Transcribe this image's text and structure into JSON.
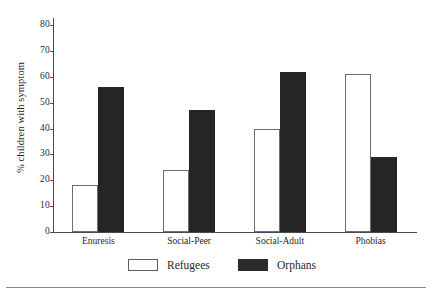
{
  "chart_data": {
    "type": "bar",
    "title": "",
    "xlabel": "",
    "ylabel": "% children with symptom",
    "ylim": [
      0,
      80
    ],
    "yticks": [
      0,
      10,
      20,
      30,
      40,
      50,
      60,
      70,
      80
    ],
    "ytick_labels": [
      "0",
      "10",
      "20",
      "30",
      "40",
      "50",
      "60",
      "70",
      "80"
    ],
    "grid": false,
    "legend_position": "bottom",
    "categories": [
      "Enuresis",
      "Social-Peer",
      "Social-Adult",
      "Phobias"
    ],
    "series": [
      {
        "name": "Refugees",
        "color": "#ffffff",
        "edge_color": "#6e6e6e",
        "values": [
          18,
          24,
          40,
          61
        ]
      },
      {
        "name": "Orphans",
        "color": "#252525",
        "edge_color": "#252525",
        "values": [
          56,
          47,
          62,
          29
        ]
      }
    ]
  },
  "legend": {
    "items": [
      {
        "label": "Refugees",
        "swatch": "open-square-swatch"
      },
      {
        "label": "Orphans",
        "swatch": "filled-square-swatch"
      }
    ]
  },
  "colors": {
    "axis": "#4a4a4a",
    "text": "#1f1f1f",
    "rule": "#8a8a8a",
    "background": "#ffffff"
  }
}
